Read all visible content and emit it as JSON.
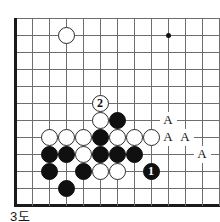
{
  "figure": {
    "caption": "3도",
    "kind": "go-board-diagram",
    "board": {
      "origin_x": 15,
      "origin_y": 18,
      "spacing": 17,
      "cols": 12,
      "rows": 11,
      "left_edge": true,
      "bottom_edge": true,
      "line_color": "#6e6e6e",
      "edge_color": "#1a1a1a"
    },
    "star_points": [
      {
        "col": 9,
        "row": 1,
        "name": "star-point"
      }
    ],
    "stones": [
      {
        "col": 3,
        "row": 1,
        "color": "white",
        "label": ""
      },
      {
        "col": 5,
        "row": 5,
        "color": "white",
        "label": "2"
      },
      {
        "col": 5,
        "row": 6,
        "color": "white",
        "label": ""
      },
      {
        "col": 6,
        "row": 6,
        "color": "black",
        "label": ""
      },
      {
        "col": 2,
        "row": 7,
        "color": "white",
        "label": ""
      },
      {
        "col": 3,
        "row": 7,
        "color": "white",
        "label": ""
      },
      {
        "col": 4,
        "row": 7,
        "color": "white",
        "label": ""
      },
      {
        "col": 5,
        "row": 7,
        "color": "black",
        "label": ""
      },
      {
        "col": 6,
        "row": 7,
        "color": "white",
        "label": ""
      },
      {
        "col": 7,
        "row": 7,
        "color": "white",
        "label": ""
      },
      {
        "col": 8,
        "row": 7,
        "color": "white",
        "label": ""
      },
      {
        "col": 2,
        "row": 8,
        "color": "black",
        "label": ""
      },
      {
        "col": 3,
        "row": 8,
        "color": "black",
        "label": ""
      },
      {
        "col": 4,
        "row": 8,
        "color": "white",
        "label": ""
      },
      {
        "col": 5,
        "row": 8,
        "color": "black",
        "label": ""
      },
      {
        "col": 6,
        "row": 8,
        "color": "black",
        "label": ""
      },
      {
        "col": 7,
        "row": 8,
        "color": "black",
        "label": ""
      },
      {
        "col": 2,
        "row": 9,
        "color": "black",
        "label": ""
      },
      {
        "col": 4,
        "row": 9,
        "color": "black",
        "label": ""
      },
      {
        "col": 5,
        "row": 9,
        "color": "white",
        "label": ""
      },
      {
        "col": 6,
        "row": 9,
        "color": "white",
        "label": ""
      },
      {
        "col": 8,
        "row": 9,
        "color": "black",
        "label": "1"
      },
      {
        "col": 3,
        "row": 10,
        "color": "black",
        "label": ""
      }
    ],
    "markers": [
      {
        "col": 9,
        "row": 6,
        "label": "A"
      },
      {
        "col": 9,
        "row": 7,
        "label": "A"
      },
      {
        "col": 10,
        "row": 7,
        "label": "A"
      },
      {
        "col": 11,
        "row": 8,
        "label": "A"
      }
    ]
  }
}
